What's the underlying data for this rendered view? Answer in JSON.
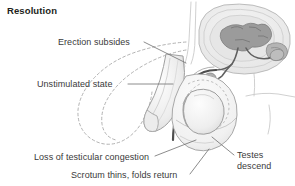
{
  "figure": {
    "title": "Resolution",
    "type": "anatomical-illustration",
    "view": "mid-sagittal-section",
    "labels": [
      {
        "id": "erection-subsides",
        "text": "Erection subsides"
      },
      {
        "id": "unstimulated-state",
        "text": "Unstimulated state"
      },
      {
        "id": "loss-of-testicular-congestion",
        "text": "Loss of testicular congestion"
      },
      {
        "id": "scrotum-thins-folds-return",
        "text": "Scrotum thins, folds return"
      },
      {
        "id": "testes-descend-line1",
        "text": "Testes"
      },
      {
        "id": "testes-descend-line2",
        "text": "descend"
      }
    ],
    "colors": {
      "ink": "#231f20",
      "label_text": "#3a3a3a",
      "leader_line": "#6f6f6f",
      "outline": "#8a8a8a",
      "outline_light": "#bdbdbd",
      "dashed_ghost": "#a7a7a7",
      "urethra_dark": "#4a4a4a",
      "organ_fill_light": "#f0f0f0",
      "organ_fill_mid": "#d8d8d8",
      "organ_fill_dark": "#9a9a9a",
      "background": "#ffffff"
    }
  }
}
